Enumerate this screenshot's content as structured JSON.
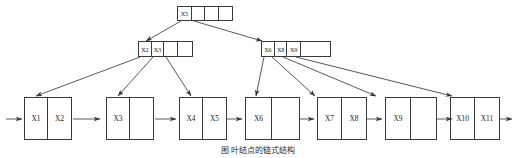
{
  "figure": {
    "type": "b-plus-tree-diagram",
    "caption": "图     叶结点的链式结构",
    "line_color": "#3b3b3b",
    "background": "#ffffff"
  },
  "tree": {
    "root": {
      "id": "root-node",
      "cells": [
        {
          "label": "X5",
          "empty": false
        },
        {
          "label": "",
          "empty": true
        },
        {
          "label": "",
          "empty": true
        },
        {
          "label": "",
          "empty": true
        }
      ]
    },
    "internal_nodes": [
      {
        "id": "internal-node-left",
        "cells": [
          {
            "label": "X2",
            "empty": false
          },
          {
            "label": "X3",
            "empty": false
          },
          {
            "label": "",
            "empty": true
          },
          {
            "label": "",
            "empty": true
          }
        ]
      },
      {
        "id": "internal-node-right",
        "cells": [
          {
            "label": "X6",
            "empty": false
          },
          {
            "label": "X8",
            "empty": false
          },
          {
            "label": "X9",
            "empty": false
          },
          {
            "label": "",
            "empty": true
          }
        ]
      }
    ],
    "leaf_nodes": [
      {
        "id": "leaf-node-1",
        "cells": [
          {
            "label": "X1"
          },
          {
            "label": "X2"
          }
        ]
      },
      {
        "id": "leaf-node-2",
        "cells": [
          {
            "label": "X3"
          },
          {
            "label": ""
          }
        ]
      },
      {
        "id": "leaf-node-3",
        "cells": [
          {
            "label": "X4"
          },
          {
            "label": "X5"
          }
        ]
      },
      {
        "id": "leaf-node-4",
        "cells": [
          {
            "label": "X6"
          },
          {
            "label": ""
          }
        ]
      },
      {
        "id": "leaf-node-5",
        "cells": [
          {
            "label": "X7"
          },
          {
            "label": "X8"
          }
        ]
      },
      {
        "id": "leaf-node-6",
        "cells": [
          {
            "label": "X9"
          },
          {
            "label": ""
          }
        ]
      },
      {
        "id": "leaf-node-7",
        "cells": [
          {
            "label": "X10"
          },
          {
            "label": "X11"
          }
        ]
      }
    ],
    "pointer_edges": [
      {
        "from": "root-node",
        "to": "internal-node-left"
      },
      {
        "from": "root-node",
        "to": "internal-node-right"
      },
      {
        "from": "internal-node-left",
        "to": "leaf-node-1"
      },
      {
        "from": "internal-node-left",
        "to": "leaf-node-2"
      },
      {
        "from": "internal-node-left",
        "to": "leaf-node-3"
      },
      {
        "from": "internal-node-right",
        "to": "leaf-node-4"
      },
      {
        "from": "internal-node-right",
        "to": "leaf-node-5"
      },
      {
        "from": "internal-node-right",
        "to": "leaf-node-6"
      },
      {
        "from": "internal-node-right",
        "to": "leaf-node-7"
      }
    ],
    "leaf_chain": [
      {
        "from": "entry",
        "to": "leaf-node-1"
      },
      {
        "from": "leaf-node-1",
        "to": "leaf-node-2"
      },
      {
        "from": "leaf-node-2",
        "to": "leaf-node-3"
      },
      {
        "from": "leaf-node-3",
        "to": "leaf-node-4"
      },
      {
        "from": "leaf-node-4",
        "to": "leaf-node-5"
      },
      {
        "from": "leaf-node-5",
        "to": "leaf-node-6"
      },
      {
        "from": "leaf-node-6",
        "to": "leaf-node-7"
      },
      {
        "from": "leaf-node-7",
        "to": "exit"
      }
    ]
  }
}
